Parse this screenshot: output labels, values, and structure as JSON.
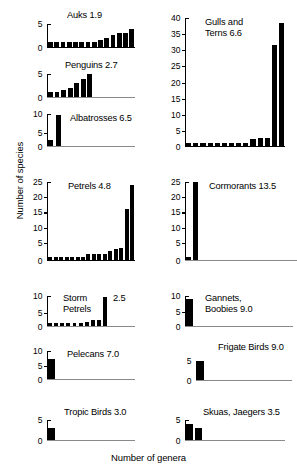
{
  "chart_data": {
    "type": "bar",
    "title": "",
    "xlabel": "Number of genera",
    "ylabel": "Number of species",
    "grid": false,
    "legend": "none",
    "panels": [
      {
        "id": "auks",
        "name": "Auks",
        "mean": "1.9",
        "title": "Auks 1.9",
        "ylim": [
          0,
          5
        ],
        "yticks": [
          0,
          5
        ],
        "yticklabels": [
          "0",
          "5"
        ],
        "n_bars": 14,
        "values": [
          1,
          1,
          1,
          1,
          1,
          1,
          1,
          1,
          1.5,
          2,
          2.5,
          3,
          3,
          4
        ]
      },
      {
        "id": "penguins",
        "name": "Penguins",
        "mean": "2.7",
        "title": "Penguins 2.7",
        "ylim": [
          0,
          5
        ],
        "yticks": [
          0,
          5
        ],
        "yticklabels": [
          "0",
          "5"
        ],
        "n_bars": 7,
        "values": [
          1,
          1,
          1.5,
          2,
          3,
          4,
          5
        ]
      },
      {
        "id": "albatrosses",
        "name": "Albatrosses",
        "mean": "6.5",
        "title": "Albatrosses 6.5",
        "ylim": [
          0,
          11.5
        ],
        "yticks": [
          0,
          5,
          10
        ],
        "yticklabels": [
          "0",
          "5",
          "10"
        ],
        "n_bars": 2,
        "values": [
          2,
          11
        ]
      },
      {
        "id": "petrels",
        "name": "Petrels",
        "mean": "4.8",
        "title": "Petrels 4.8",
        "ylim": [
          0,
          26
        ],
        "yticks": [
          0,
          5,
          10,
          15,
          20,
          25
        ],
        "yticklabels": [
          "0",
          "5",
          "10",
          "15",
          "20",
          "25"
        ],
        "n_bars": 16,
        "values": [
          1,
          1,
          1,
          1,
          1,
          1,
          1,
          2,
          2,
          2,
          2,
          3,
          3.5,
          4,
          17,
          25
        ]
      },
      {
        "id": "storm-petrels",
        "name": "Storm Petrels",
        "mean": "2.5",
        "title": "Storm\nPetrels",
        "ylim": [
          0,
          11
        ],
        "yticks": [
          0,
          5,
          10
        ],
        "yticklabels": [
          "0",
          "5",
          "10"
        ],
        "n_bars": 9,
        "values": [
          1,
          1,
          1,
          1,
          1,
          1,
          1.5,
          2,
          2,
          10.5
        ]
      },
      {
        "id": "pelecans",
        "name": "Pelecans",
        "mean": "7.0",
        "title": "Pelecans 7.0",
        "ylim": [
          0,
          10
        ],
        "yticks": [
          0,
          5,
          10
        ],
        "yticklabels": [
          "0",
          "5",
          "10"
        ],
        "n_bars": 1,
        "values": [
          7
        ]
      },
      {
        "id": "tropic-birds",
        "name": "Tropic Birds",
        "mean": "3.0",
        "title": "Tropic Birds 3.0",
        "ylim": [
          0,
          5
        ],
        "yticks": [
          0,
          5
        ],
        "yticklabels": [
          "0",
          "5"
        ],
        "n_bars": 1,
        "values": [
          3
        ]
      },
      {
        "id": "gulls-and-terns",
        "name": "Gulls and Terns",
        "mean": "6.6",
        "title": "Gulls and\nTerns 6.6",
        "ylim": [
          0,
          40
        ],
        "yticks": [
          0,
          5,
          10,
          15,
          20,
          25,
          30,
          35,
          40
        ],
        "yticklabels": [
          "0",
          "5",
          "10",
          "15",
          "20",
          "25",
          "30",
          "35",
          "40"
        ],
        "n_bars": 14,
        "values": [
          1,
          1,
          1,
          1,
          1,
          1,
          1,
          1,
          1,
          2,
          2.5,
          2.5,
          31.5,
          38.5
        ]
      },
      {
        "id": "cormorants",
        "name": "Cormorants",
        "mean": "13.5",
        "title": "Cormorants 13.5",
        "ylim": [
          0,
          26
        ],
        "yticks": [
          0,
          5,
          10,
          15,
          20,
          25
        ],
        "yticklabels": [
          "0",
          "5",
          "10",
          "15",
          "20",
          "25"
        ],
        "n_bars": 2,
        "values": [
          1,
          26
        ]
      },
      {
        "id": "gannets-boobies",
        "name": "Gannets, Boobies",
        "mean": "9.0",
        "title": "Gannets,\nBoobies 9.0",
        "ylim": [
          0,
          10
        ],
        "yticks": [
          0,
          5,
          10
        ],
        "yticklabels": [
          "0",
          "5",
          "10"
        ],
        "n_bars": 1,
        "values": [
          9
        ]
      },
      {
        "id": "frigate-birds",
        "name": "Frigate Birds",
        "mean": "9.0",
        "title": "Frigate Birds 9.0",
        "ylim": [
          0,
          5
        ],
        "yticks": [
          0,
          5
        ],
        "yticklabels": [
          "0",
          "5"
        ],
        "n_bars": 1,
        "values": [
          5
        ]
      },
      {
        "id": "skuas-jaegers",
        "name": "Skuas, Jaegers",
        "mean": "3.5",
        "title": "Skuas, Jaegers 3.5",
        "ylim": [
          0,
          5
        ],
        "yticks": [
          0,
          5
        ],
        "yticklabels": [
          "0",
          "5"
        ],
        "n_bars": 2,
        "values": [
          4,
          3
        ]
      }
    ]
  },
  "labels": {
    "ylabel": "Number of species",
    "xlabel": "Number of genera"
  },
  "panel_titles": {
    "auks": "Auks 1.9",
    "penguins": "Penguins 2.7",
    "albatrosses": "Albatrosses 6.5",
    "petrels": "Petrels 4.8",
    "storm_petrels": "Storm\nPetrels",
    "storm_petrels_mean": "2.5",
    "pelecans": "Pelecans 7.0",
    "tropic_birds": "Tropic Birds 3.0",
    "gulls_and_terns": "Gulls and\nTerns 6.6",
    "cormorants": "Cormorants 13.5",
    "gannets_boobies": "Gannets,\nBoobies 9.0",
    "frigate_birds": "Frigate Birds 9.0",
    "skuas_jaegers": "Skuas, Jaegers 3.5"
  }
}
